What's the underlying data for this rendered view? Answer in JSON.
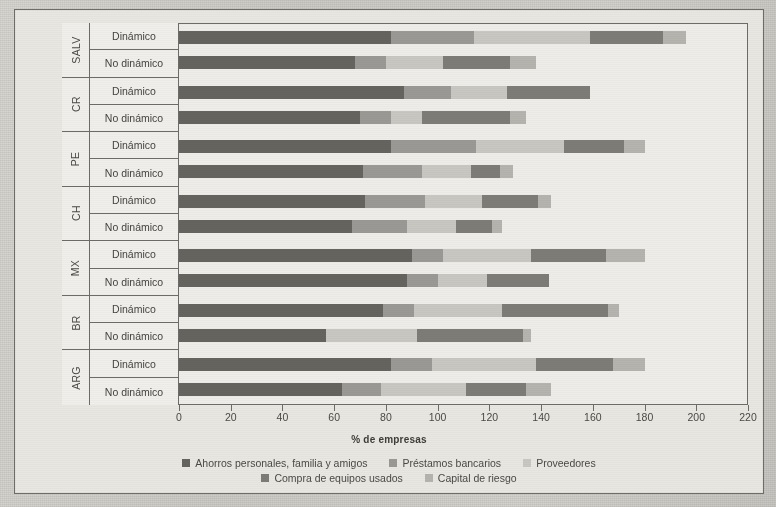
{
  "chart_data": {
    "type": "bar",
    "orientation": "horizontal",
    "stacked": true,
    "title": "",
    "xlabel": "% de empresas",
    "ylabel": "",
    "xlim": [
      0,
      220
    ],
    "xticks": [
      0,
      20,
      40,
      60,
      80,
      100,
      120,
      140,
      160,
      180,
      200,
      220
    ],
    "grid": false,
    "legend_position": "bottom",
    "series": [
      {
        "name": "Ahorros personales, familia y amigos",
        "color": "#66645f"
      },
      {
        "name": "Préstamos bancarios",
        "color": "#9b9995"
      },
      {
        "name": "Proveedores",
        "color": "#c9c7c2"
      },
      {
        "name": "Compra de equipos usados",
        "color": "#7e7c77"
      },
      {
        "name": "Capital de riesgo",
        "color": "#b6b4af"
      }
    ],
    "groups": [
      {
        "country": "SALV",
        "rows": [
          {
            "label": "Dinámico",
            "values": [
              82,
              32,
              45,
              28,
              9
            ],
            "total": 196
          },
          {
            "label": "No dinámico",
            "values": [
              68,
              12,
              22,
              26,
              10
            ],
            "total": 138
          }
        ]
      },
      {
        "country": "CR",
        "rows": [
          {
            "label": "Dinámico",
            "values": [
              87,
              18,
              22,
              32,
              0
            ],
            "total": 159
          },
          {
            "label": "No dinámico",
            "values": [
              70,
              12,
              12,
              34,
              6
            ],
            "total": 134
          }
        ]
      },
      {
        "country": "PE",
        "rows": [
          {
            "label": "Dinámico",
            "values": [
              82,
              33,
              34,
              23,
              8
            ],
            "total": 180
          },
          {
            "label": "No dinámico",
            "values": [
              71,
              23,
              19,
              11,
              5
            ],
            "total": 129
          }
        ]
      },
      {
        "country": "CH",
        "rows": [
          {
            "label": "Dinámico",
            "values": [
              72,
              23,
              22,
              22,
              5
            ],
            "total": 144
          },
          {
            "label": "No dinámico",
            "values": [
              67,
              21,
              19,
              14,
              4
            ],
            "total": 125
          }
        ]
      },
      {
        "country": "MX",
        "rows": [
          {
            "label": "Dinámico",
            "values": [
              90,
              12,
              34,
              29,
              15
            ],
            "total": 180
          },
          {
            "label": "No dinámico",
            "values": [
              88,
              12,
              19,
              24,
              0
            ],
            "total": 143
          }
        ]
      },
      {
        "country": "BR",
        "rows": [
          {
            "label": "Dinámico",
            "values": [
              79,
              12,
              34,
              41,
              4
            ],
            "total": 170
          },
          {
            "label": "No dinámico",
            "values": [
              57,
              0,
              35,
              41,
              3
            ],
            "total": 136
          }
        ]
      },
      {
        "country": "ARG",
        "rows": [
          {
            "label": "Dinámico",
            "values": [
              82,
              16,
              40,
              30,
              12
            ],
            "total": 180
          },
          {
            "label": "No dinámico",
            "values": [
              63,
              15,
              33,
              23,
              10
            ],
            "total": 144
          }
        ]
      }
    ]
  }
}
